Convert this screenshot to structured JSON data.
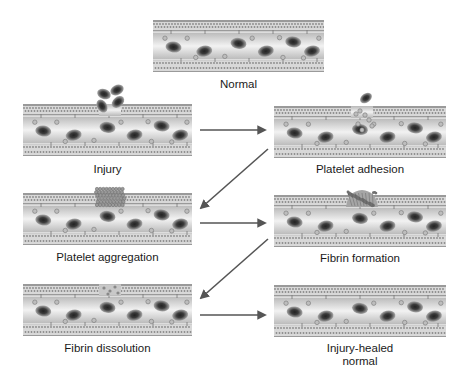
{
  "colors": {
    "wall_outer": "#9a9a9a",
    "wall_pattern": "#d8d8d8",
    "lumen_center": "#f2f2f2",
    "lumen_edge": "#b8b8b8",
    "rbc_rim": "#8c8c8c",
    "rbc_core": "#3a3a3a",
    "platelet": "#bdbdbd",
    "arrow": "#555555"
  },
  "panels": [
    {
      "id": "normal",
      "label": "Normal",
      "x": 153,
      "y": 20,
      "w": 171,
      "h": 52,
      "state": "normal",
      "label_y": 78
    },
    {
      "id": "injury",
      "label": "Injury",
      "x": 23,
      "y": 104,
      "w": 169,
      "h": 52,
      "state": "injury",
      "label_y": 163
    },
    {
      "id": "platelet-adhesion",
      "label": "Platelet adhesion",
      "x": 274,
      "y": 106,
      "w": 172,
      "h": 52,
      "state": "adhesion",
      "label_y": 163
    },
    {
      "id": "platelet-aggregation",
      "label": "Platelet aggregation",
      "x": 23,
      "y": 193,
      "w": 169,
      "h": 52,
      "state": "aggregation",
      "label_y": 251
    },
    {
      "id": "fibrin-formation",
      "label": "Fibrin formation",
      "x": 274,
      "y": 195,
      "w": 172,
      "h": 52,
      "state": "fibrin",
      "label_y": 252
    },
    {
      "id": "fibrin-dissolution",
      "label": "Fibrin dissolution",
      "x": 23,
      "y": 284,
      "w": 169,
      "h": 52,
      "state": "dissolution",
      "label_y": 342
    },
    {
      "id": "injury-healed-normal",
      "label": "Injury-healed\nnormal",
      "x": 274,
      "y": 285,
      "w": 172,
      "h": 52,
      "state": "normal",
      "label_y": 342
    }
  ],
  "arrows": [
    {
      "from": "injury",
      "to": "platelet-adhesion",
      "x1": 200,
      "y1": 130,
      "x2": 265,
      "y2": 130
    },
    {
      "from": "platelet-adhesion",
      "to": "platelet-aggregation",
      "x1": 268,
      "y1": 149,
      "x2": 201,
      "y2": 208
    },
    {
      "from": "platelet-aggregation",
      "to": "fibrin-formation",
      "x1": 200,
      "y1": 223,
      "x2": 265,
      "y2": 223
    },
    {
      "from": "fibrin-formation",
      "to": "fibrin-dissolution",
      "x1": 268,
      "y1": 239,
      "x2": 201,
      "y2": 298
    },
    {
      "from": "fibrin-dissolution",
      "to": "injury-healed-normal",
      "x1": 200,
      "y1": 315,
      "x2": 265,
      "y2": 315
    }
  ]
}
